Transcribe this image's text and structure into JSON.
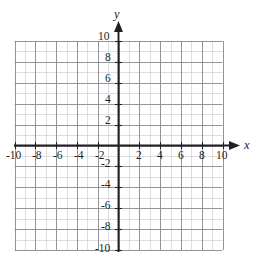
{
  "figure": {
    "kind": "cartesian-coordinate-grid",
    "title": "",
    "background_color": "#ffffff"
  },
  "axes": {
    "x_axis_name": "x",
    "y_axis_name": "y",
    "axis_color": "#231f20",
    "minor_grid_color": "#cfcfd4",
    "major_grid_color": "#8e8e96"
  },
  "chart_data": {
    "type": "scatter",
    "title": "",
    "xlabel": "x",
    "ylabel": "y",
    "xlim": [
      -10,
      10
    ],
    "ylim": [
      -10,
      10
    ],
    "grid": true,
    "grid_minor_step": 1,
    "grid_major_step": 2,
    "legend": null,
    "series": [
      {
        "name": "",
        "x": [],
        "y": []
      }
    ],
    "x_tick_labels": [
      "-10",
      "-8",
      "-6",
      "-4",
      "-2",
      "2",
      "4",
      "6",
      "8",
      "10"
    ],
    "x_tick_values": [
      -10,
      -8,
      -6,
      -4,
      -2,
      2,
      4,
      6,
      8,
      10
    ],
    "y_tick_labels": [
      "10",
      "8",
      "6",
      "4",
      "2",
      "-2",
      "-4",
      "-6",
      "-8",
      "-10"
    ],
    "y_tick_values": [
      10,
      8,
      6,
      4,
      2,
      -2,
      -4,
      -6,
      -8,
      -10
    ],
    "annotations": []
  },
  "x_ticks": [
    {
      "label": "-10",
      "value": -10
    },
    {
      "label": "-8",
      "value": -8
    },
    {
      "label": "-6",
      "value": -6
    },
    {
      "label": "-4",
      "value": -4
    },
    {
      "label": "-2",
      "value": -2
    },
    {
      "label": "2",
      "value": 2
    },
    {
      "label": "4",
      "value": 4
    },
    {
      "label": "6",
      "value": 6
    },
    {
      "label": "8",
      "value": 8
    },
    {
      "label": "10",
      "value": 10
    }
  ],
  "y_ticks": [
    {
      "label": "10",
      "value": 10
    },
    {
      "label": "8",
      "value": 8
    },
    {
      "label": "6",
      "value": 6
    },
    {
      "label": "4",
      "value": 4
    },
    {
      "label": "2",
      "value": 2
    },
    {
      "label": "-2",
      "value": -2
    },
    {
      "label": "-4",
      "value": -4
    },
    {
      "label": "-6",
      "value": -6
    },
    {
      "label": "-8",
      "value": -8
    },
    {
      "label": "-10",
      "value": -10
    }
  ]
}
